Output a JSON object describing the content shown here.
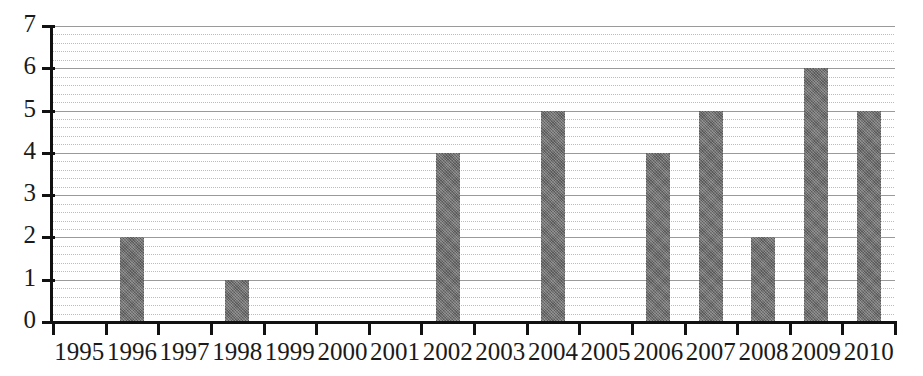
{
  "chart_data": {
    "type": "bar",
    "title": "",
    "subtitle": "",
    "xlabel": "",
    "ylabel": "",
    "categories": [
      "1995",
      "1996",
      "1997",
      "1998",
      "1999",
      "2000",
      "2001",
      "2002",
      "2003",
      "2004",
      "2005",
      "2006",
      "2007",
      "2008",
      "2009",
      "2010"
    ],
    "values": [
      0,
      2,
      0,
      1,
      0,
      0,
      0,
      4,
      0,
      5,
      0,
      4,
      5,
      2,
      6,
      5
    ],
    "ylim": [
      0,
      7
    ],
    "y_ticks": [
      0,
      1,
      2,
      3,
      4,
      5,
      6,
      7
    ],
    "y_tick_labels": [
      "0",
      "1",
      "2",
      "3",
      "4",
      "5",
      "6",
      "7"
    ],
    "y_minor_step": 0.2,
    "grid": true,
    "grid_axis": "y",
    "legend": null,
    "legend_position": "none",
    "annotations": [],
    "series": [
      {
        "name": "",
        "color": "#6c6c6c",
        "values": [
          0,
          2,
          0,
          1,
          0,
          0,
          0,
          4,
          0,
          5,
          0,
          4,
          5,
          2,
          6,
          5
        ]
      }
    ]
  },
  "colors": {
    "bar_fill": "#6c6c6c",
    "axis": "#111111",
    "gridline_major": "#9a9a9a",
    "gridline_minor": "#bcbcbc",
    "background": "#ffffff",
    "text": "#1a1a1a"
  }
}
